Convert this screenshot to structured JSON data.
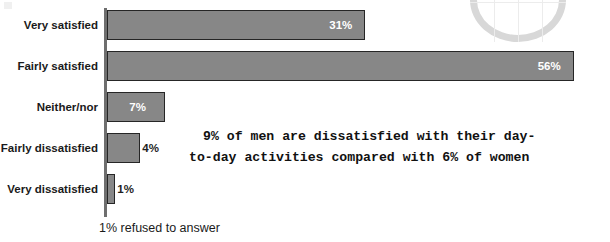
{
  "chart_data": {
    "type": "bar",
    "orientation": "horizontal",
    "title": "",
    "subtitle": "",
    "xlabel": "",
    "ylabel": "",
    "xlim": [
      0,
      60
    ],
    "grid": false,
    "legend": null,
    "categories": [
      "Very satisfied",
      "Fairly satisfied",
      "Neither/nor",
      "Fairly dissatisfied",
      "Very dissatisfied"
    ],
    "values": [
      31,
      56,
      7,
      4,
      1
    ],
    "value_labels": [
      "31%",
      "56%",
      "7%",
      "4%",
      "1%"
    ],
    "bar_color": "#878787",
    "bar_border_color": "#262626",
    "label_color_inside": "#ffffff",
    "label_color_outside": "#1f1f1f",
    "footnote": "1% refused to answer",
    "annotation": {
      "line1": "9% of men are dissatisfied with their day-",
      "line2": "to-day activities compared with 6% of women",
      "full_text": "9% of men are dissatisfied with their day-to-day activities compared with 6% of women"
    }
  },
  "decorations": {
    "globe_icon": "globe-wireframe",
    "corner_mark": "corner-artifact"
  }
}
